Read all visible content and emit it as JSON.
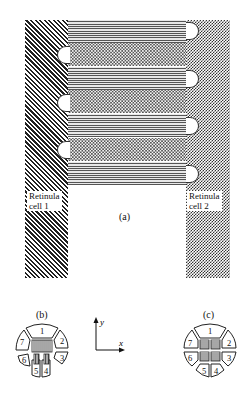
{
  "figure": {
    "panel_a": {
      "caption": "(a)",
      "left_cell_label_line1": "Retinula",
      "left_cell_label_line2": "cell 1",
      "right_cell_label_line1": "Retinula",
      "right_cell_label_line2": "cell 2",
      "bands": [
        "lines",
        "dots",
        "lines",
        "dots",
        "lines",
        "dots",
        "lines"
      ]
    },
    "panel_b": {
      "caption": "(b)",
      "segments": [
        "1",
        "2",
        "3",
        "4",
        "5",
        "6",
        "7"
      ]
    },
    "panel_c": {
      "caption": "(c)",
      "segments": [
        "1",
        "2",
        "3",
        "4",
        "5",
        "6",
        "7"
      ]
    },
    "axes": {
      "x_label": "x",
      "y_label": "y"
    }
  }
}
